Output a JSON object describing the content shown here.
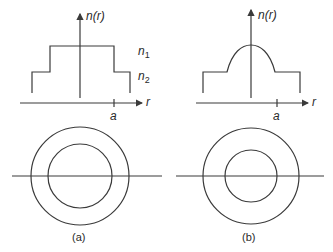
{
  "figure": {
    "panels": [
      {
        "id": "a",
        "label": "(a)",
        "profile_type": "step-index",
        "y_axis_label": "n(r)",
        "x_axis_label": "r",
        "x_tick_label": "a",
        "level_labels": {
          "upper": "n",
          "upper_sub": "1",
          "lower": "n",
          "lower_sub": "2"
        }
      },
      {
        "id": "b",
        "label": "(b)",
        "profile_type": "graded-index",
        "y_axis_label": "n(r)",
        "x_axis_label": "r",
        "x_tick_label": "a"
      }
    ],
    "colors": {
      "line": "#3a3a3a",
      "text": "#2a2a2a",
      "background": "#ffffff"
    }
  }
}
